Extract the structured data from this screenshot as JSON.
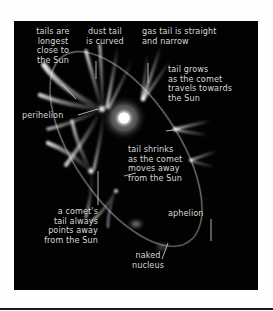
{
  "figure": {
    "background_color": "#020202",
    "page_color": "#fefefe",
    "label_color": "#d8d8d8",
    "labels": [
      {
        "id": "tails-longest",
        "text": "tails are\nlongest\nclose to\nthe Sun"
      },
      {
        "id": "dust-tail",
        "text": "dust tail\nis curved"
      },
      {
        "id": "gas-tail",
        "text": "gas tail is straight\nand narrow"
      },
      {
        "id": "tail-grows",
        "text": "tail grows\nas the comet\ntravels towards\nthe Sun"
      },
      {
        "id": "perihelion",
        "text": "perihelion"
      },
      {
        "id": "tail-shrinks",
        "text": "tail shrinks\nas the comet\nmoves away\nfrom the Sun"
      },
      {
        "id": "comet-tail-away",
        "text": "a comet's\ntail always\npoints away\nfrom the Sun"
      },
      {
        "id": "aphelion",
        "text": "aphelion"
      },
      {
        "id": "naked-nucleus",
        "text": "naked\nnucleus"
      }
    ],
    "objects": {
      "sun": "sun-glow",
      "orbit": "elliptical-orbit-path",
      "comets": [
        "comet-perihelion-large",
        "comet-inbound-upper",
        "comet-outbound-right",
        "comet-outbound-lower-right",
        "comet-lower-left-large",
        "comet-lower-mid",
        "comet-faint-nucleus"
      ]
    }
  }
}
